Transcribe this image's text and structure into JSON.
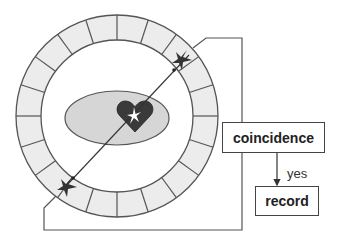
{
  "diagram": {
    "type": "PET scanner coincidence detection schematic",
    "detector_ring": {
      "segments": 20,
      "fill": "#ececec",
      "stroke": "#555555"
    },
    "patient_body": {
      "shape": "ellipse",
      "fill": "#d6d6d6"
    },
    "source": {
      "shape": "heart",
      "fill": "#3a3a3a",
      "annihilation_flash": "#ffffff"
    },
    "detection_markers": [
      "top-right detector hit",
      "bottom-left detector hit"
    ],
    "boxes": {
      "coincidence": {
        "label": "coincidence"
      },
      "record": {
        "label": "record"
      }
    },
    "arrow_label": "yes",
    "colors": {
      "line": "#444444",
      "ring_fill": "#ececec",
      "ellipse_fill": "#d6d6d6",
      "heart": "#3a3a3a"
    }
  }
}
